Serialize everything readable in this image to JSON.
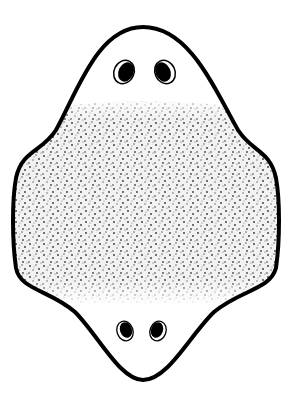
{
  "figure": {
    "outline_color": "#000000",
    "fill_color": "#ffffff",
    "stipple_color": "#3a3a3a",
    "eye_spots": {
      "top": [
        {
          "cx": 124,
          "cy": 72
        },
        {
          "cx": 165,
          "cy": 72
        }
      ],
      "bottom": [
        {
          "cx": 125,
          "cy": 331
        },
        {
          "cx": 158,
          "cy": 331
        }
      ]
    }
  }
}
